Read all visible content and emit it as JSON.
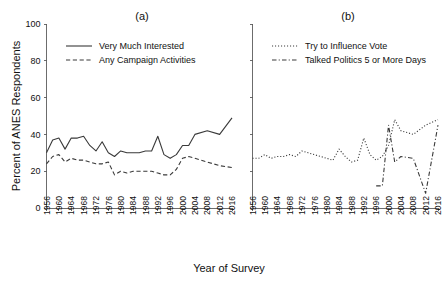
{
  "figure": {
    "xlabel": "Year of Survey",
    "ylabel": "Percent of ANES Respondents"
  },
  "chart_data": [
    {
      "type": "line",
      "title": "(a)",
      "xlabel": "Year of Survey",
      "ylabel": "Percent of ANES Respondents",
      "grid": false,
      "legend_position": "top-left",
      "ylim": [
        0,
        100
      ],
      "yticks": [
        0,
        20,
        40,
        60,
        80,
        100
      ],
      "xlim": [
        1956,
        2016
      ],
      "xticks": [
        1956,
        1960,
        1964,
        1968,
        1972,
        1976,
        1980,
        1984,
        1988,
        1992,
        1996,
        2000,
        2004,
        2008,
        2012,
        2016
      ],
      "x": [
        1956,
        1958,
        1960,
        1962,
        1964,
        1966,
        1968,
        1970,
        1972,
        1974,
        1976,
        1978,
        1980,
        1982,
        1984,
        1986,
        1988,
        1990,
        1992,
        1994,
        1996,
        1998,
        2000,
        2002,
        2004,
        2008,
        2012,
        2016
      ],
      "series": [
        {
          "name": "Very Much Interested",
          "style": "solid",
          "values": [
            30,
            37,
            38,
            32,
            38,
            38,
            39,
            34,
            31,
            36,
            30,
            28,
            31,
            30,
            30,
            30,
            31,
            31,
            39,
            29,
            27,
            29,
            34,
            34,
            40,
            42,
            40,
            49
          ]
        },
        {
          "name": "Any Campaign Activities",
          "style": "dashed",
          "values": [
            24,
            28,
            29,
            25,
            27,
            26,
            26,
            25,
            24,
            24,
            25,
            18,
            20,
            19,
            20,
            20,
            20,
            20,
            19,
            18,
            18,
            21,
            27,
            28,
            27,
            25,
            23,
            22
          ]
        }
      ]
    },
    {
      "type": "line",
      "title": "(b)",
      "xlabel": "Year of Survey",
      "ylabel": "Percent of ANES Respondents",
      "grid": false,
      "legend_position": "top-left",
      "ylim": [
        0,
        100
      ],
      "yticks": [
        0,
        20,
        40,
        60,
        80,
        100
      ],
      "xlim": [
        1956,
        2016
      ],
      "xticks": [
        1956,
        1960,
        1964,
        1968,
        1972,
        1976,
        1980,
        1984,
        1988,
        1992,
        1996,
        2000,
        2004,
        2008,
        2012,
        2016
      ],
      "series": [
        {
          "name": "Try to Influence Vote",
          "style": "dotted",
          "x": [
            1956,
            1958,
            1960,
            1962,
            1964,
            1966,
            1968,
            1970,
            1972,
            1974,
            1976,
            1978,
            1980,
            1982,
            1984,
            1986,
            1988,
            1990,
            1992,
            1994,
            1996,
            1998,
            2000,
            2002,
            2004,
            2008,
            2012,
            2016
          ],
          "values": [
            27,
            27,
            29,
            27,
            28,
            28,
            29,
            28,
            31,
            30,
            29,
            28,
            27,
            26,
            32,
            28,
            25,
            26,
            38,
            29,
            26,
            28,
            34,
            48,
            42,
            40,
            45,
            48
          ]
        },
        {
          "name": "Talked Politics 5 or More Days",
          "style": "dashdot",
          "x": [
            1996,
            1998,
            2000,
            2002,
            2004,
            2008,
            2012,
            2016
          ],
          "values": [
            12,
            12,
            45,
            25,
            28,
            27,
            8,
            45
          ]
        }
      ]
    }
  ],
  "panel_a": {
    "title": "(a)",
    "legend": [
      {
        "label": "Very Much Interested",
        "style": "solid"
      },
      {
        "label": "Any Campaign Activities",
        "style": "dashed"
      }
    ]
  },
  "panel_b": {
    "title": "(b)",
    "legend": [
      {
        "label": "Try to Influence Vote",
        "style": "dotted"
      },
      {
        "label": "Talked Politics 5 or More Days",
        "style": "dashdot"
      }
    ]
  },
  "axes": {
    "ytick_labels": [
      "100",
      "80",
      "60",
      "40",
      "20",
      "0"
    ],
    "xtick_labels": [
      "1956",
      "1960",
      "1964",
      "1968",
      "1972",
      "1976",
      "1980",
      "1984",
      "1988",
      "1992",
      "1996",
      "2000",
      "2004",
      "2008",
      "2012",
      "2016"
    ]
  }
}
